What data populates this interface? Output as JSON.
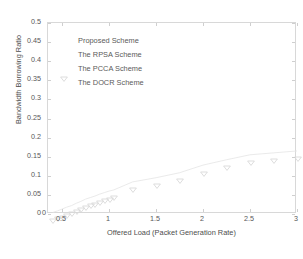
{
  "chart_data": {
    "type": "scatter",
    "title": "",
    "xlabel": "Offered Load (Packet Generation Rate)",
    "ylabel": "Bandwidth Borrowing Ratio",
    "xlim": [
      0.35,
      3.0
    ],
    "ylim": [
      0,
      0.5
    ],
    "xticks": [
      0.5,
      1,
      1.5,
      2,
      2.5,
      3
    ],
    "xticklabels": [
      "0.5",
      "1",
      "1.5",
      "2",
      "2.5",
      "3"
    ],
    "yticks": [
      0,
      0.05,
      0.1,
      0.15,
      0.2,
      0.25,
      0.3,
      0.35,
      0.4,
      0.45,
      0.5
    ],
    "yticklabels": [
      "0",
      "0.05",
      "0.1",
      "0.15",
      "0.2",
      "0.25",
      "0.3",
      "0.35",
      "0.4",
      "0.45",
      "0.5"
    ],
    "grid": false,
    "legend_position": "upper-left-inside",
    "marker": "down-triangle",
    "marker_color": "#d9d9d9",
    "line_color": "#e4e4e4",
    "series": [
      {
        "name": "Proposed Scheme",
        "x": [
          0.4,
          0.45,
          0.5,
          0.55,
          0.6,
          0.65,
          0.7,
          0.75,
          0.8,
          0.85,
          0.9,
          0.95,
          1.0,
          1.05,
          1.25,
          1.5,
          1.75,
          2.0,
          2.25,
          2.5,
          2.75,
          3.0
        ],
        "y": [
          0.004,
          0.008,
          0.013,
          0.018,
          0.022,
          0.028,
          0.033,
          0.039,
          0.043,
          0.047,
          0.052,
          0.056,
          0.06,
          0.063,
          0.084,
          0.095,
          0.108,
          0.128,
          0.142,
          0.155,
          0.16,
          0.165
        ]
      },
      {
        "name": "The RPSA Scheme",
        "x": [],
        "y": []
      },
      {
        "name": "The PCCA Scheme",
        "x": [],
        "y": []
      },
      {
        "name": "The DOCR Scheme",
        "x": [],
        "y": []
      }
    ]
  },
  "legend": {
    "items": [
      {
        "label": "Proposed Scheme"
      },
      {
        "label": "The RPSA Scheme"
      },
      {
        "label": "The PCCA Scheme"
      },
      {
        "label": "The DOCR Scheme"
      }
    ]
  },
  "axes": {
    "x_title": "Offered Load (Packet Generation Rate)",
    "y_title": "Bandwidth Borrowing Ratio"
  }
}
